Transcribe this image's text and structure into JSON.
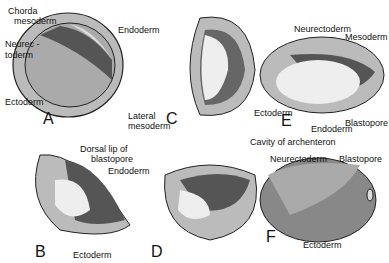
{
  "panels": {
    "A": {
      "letter": "A",
      "labels": {
        "chorda": "Chorda",
        "chorda2": "mesoderm",
        "neurec": "Neurec -",
        "neurec2": "toderm",
        "ectoderm": "Ectoderm",
        "endoderm": "Endoderm",
        "lateral": "Lateral",
        "lateral2": "mesoderm"
      }
    },
    "B": {
      "letter": "B",
      "labels": {
        "dorsal": "Dorsal lip of",
        "dorsal2": "blastopore",
        "endoderm": "Endoderm",
        "ectoderm": "Ectoderm"
      }
    },
    "C": {
      "letter": "C"
    },
    "D": {
      "letter": "D"
    },
    "E": {
      "letter": "E",
      "labels": {
        "neurectoderm": "Neurectoderm",
        "mesoderm": "Mesoderm",
        "ectoderm": "Ectoderm",
        "endoderm": "Endoderm",
        "blastopore": "Blastopore",
        "cavity": "Cavity of archenteron"
      }
    },
    "F": {
      "letter": "F",
      "labels": {
        "neurectoderm": "Neurectoderm",
        "blastopore": "Blastopore",
        "ectoderm": "Ectoderm"
      }
    }
  },
  "colors": {
    "dark": "#555555",
    "mid": "#999999",
    "light": "#cccccc",
    "pale": "#eeeeee"
  }
}
